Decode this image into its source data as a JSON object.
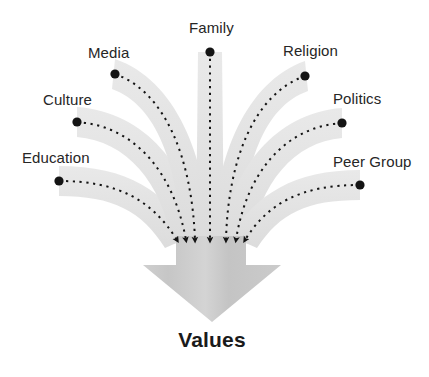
{
  "diagram": {
    "title_visible": false,
    "outcome": {
      "label": "Values",
      "x": 212,
      "y": 343
    },
    "colors": {
      "band": "#e3e3e3",
      "band_light": "#ededed",
      "arrow": "#c9c9c9",
      "arrow_edge": "#bdbdbd",
      "dot": "#141414",
      "dash": "#141414",
      "label_text": "#262626",
      "outcome_text": "#1a1a1a",
      "background": "#ffffff"
    },
    "convergence_point": {
      "x": 210,
      "y": 243
    },
    "sources": [
      {
        "id": "education",
        "label": "Education",
        "label_x": 22,
        "label_y": 162,
        "dot_x": 59,
        "dot_y": 181,
        "arrow_tip_x": 177,
        "arrow_tip_y": 240,
        "path": "M 59 181 C 118 181 152 200 177 240",
        "band": "M 59 166 C 128 166 166 192 192 236 L 165 248 C 142 211 113 196 59 196 Z"
      },
      {
        "id": "culture",
        "label": "Culture",
        "label_x": 43,
        "label_y": 104,
        "dot_x": 77,
        "dot_y": 122,
        "arrow_tip_x": 186,
        "arrow_tip_y": 240,
        "path": "M 77 122 C 136 126 174 174 186 240",
        "band": "M 77 107 C 146 112 190 168 201 238 L 172 244 C 162 182 126 141 77 137 Z"
      },
      {
        "id": "media",
        "label": "Media",
        "label_x": 88,
        "label_y": 57,
        "dot_x": 115,
        "dot_y": 74,
        "arrow_tip_x": 195,
        "arrow_tip_y": 240,
        "path": "M 115 74 C 166 92 192 160 195 240",
        "band": "M 115 59 C 176 80 206 156 210 239 L 181 241 C 178 166 157 105 112 89 Z"
      },
      {
        "id": "family",
        "label": "Family",
        "label_x": 189,
        "label_y": 32,
        "dot_x": 210,
        "dot_y": 52,
        "arrow_tip_x": 210,
        "arrow_tip_y": 240,
        "path": "M 210 52 L 210 240",
        "band": "M 198 52 L 222 52 L 224 240 L 196 240 Z"
      },
      {
        "id": "religion",
        "label": "Religion",
        "label_x": 283,
        "label_y": 55,
        "dot_x": 305,
        "dot_y": 76,
        "arrow_tip_x": 226,
        "arrow_tip_y": 240,
        "path": "M 305 76 C 254 94 228 160 226 240",
        "band": "M 305 61 C 246 82 216 156 212 239 L 241 241 C 244 166 263 107 308 91 Z"
      },
      {
        "id": "politics",
        "label": "Politics",
        "label_x": 333,
        "label_y": 103,
        "dot_x": 342,
        "dot_y": 123,
        "arrow_tip_x": 236,
        "arrow_tip_y": 240,
        "path": "M 342 123 C 283 127 246 175 236 240",
        "band": "M 342 108 C 275 113 232 169 221 238 L 250 244 C 260 183 294 142 342 138 Z"
      },
      {
        "id": "peer-group",
        "label": "Peer Group",
        "label_x": 333,
        "label_y": 166,
        "dot_x": 360,
        "dot_y": 185,
        "arrow_tip_x": 245,
        "arrow_tip_y": 240,
        "path": "M 360 185 C 301 185 268 203 245 240",
        "band": "M 360 170 C 293 170 256 195 230 236 L 257 248 C 280 213 307 200 360 200 Z"
      }
    ],
    "arrow": {
      "shaft_left": 176,
      "shaft_right": 246,
      "shaft_top": 236,
      "head_left": 143,
      "head_right": 281,
      "head_top": 265,
      "tip_x": 212,
      "tip_y": 322,
      "shape": "M 176 236 L 246 236 L 246 265 L 281 265 L 212 322 L 143 265 L 176 265 Z"
    }
  }
}
